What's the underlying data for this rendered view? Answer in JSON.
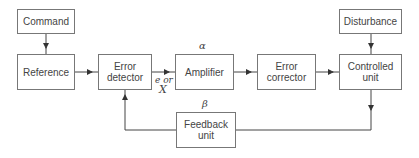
{
  "diagram": {
    "blocks": {
      "command": "Command",
      "reference": "Reference",
      "error_detector": "Error detector",
      "amplifier": "Amplifier",
      "error_corrector": "Error corrector",
      "controlled_unit": "Controlled unit",
      "disturbance": "Disturbance",
      "feedback_unit": "Feedback unit"
    },
    "labels": {
      "alpha": "α",
      "beta": "β",
      "error_signal_line1": "e or",
      "error_signal_line2": "X"
    },
    "connections": [
      {
        "from": "Command",
        "to": "Reference"
      },
      {
        "from": "Reference",
        "to": "Error detector"
      },
      {
        "from": "Error detector",
        "to": "Amplifier",
        "label": "e or X"
      },
      {
        "from": "Amplifier",
        "to": "Error corrector"
      },
      {
        "from": "Error corrector",
        "to": "Controlled unit"
      },
      {
        "from": "Disturbance",
        "to": "Controlled unit"
      },
      {
        "from": "Controlled unit",
        "to": "Feedback unit"
      },
      {
        "from": "Feedback unit",
        "to": "Error detector"
      }
    ]
  }
}
